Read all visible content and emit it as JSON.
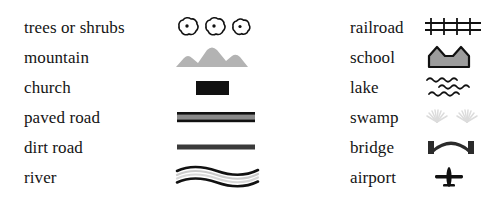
{
  "legend": {
    "columns": [
      {
        "name": "left-column",
        "items": [
          {
            "label": "trees or shrubs",
            "symbol": "trees-symbol"
          },
          {
            "label": "mountain",
            "symbol": "mountain-symbol"
          },
          {
            "label": "church",
            "symbol": "church-symbol"
          },
          {
            "label": "paved road",
            "symbol": "paved-road-symbol"
          },
          {
            "label": "dirt road",
            "symbol": "dirt-road-symbol"
          },
          {
            "label": "river",
            "symbol": "river-symbol"
          }
        ]
      },
      {
        "name": "right-column",
        "items": [
          {
            "label": "railroad",
            "symbol": "railroad-symbol"
          },
          {
            "label": "school",
            "symbol": "school-symbol"
          },
          {
            "label": "lake",
            "symbol": "lake-symbol"
          },
          {
            "label": "swamp",
            "symbol": "swamp-symbol"
          },
          {
            "label": "bridge",
            "symbol": "bridge-symbol"
          },
          {
            "label": "airport",
            "symbol": "airport-symbol"
          }
        ]
      }
    ]
  },
  "colors": {
    "background": "#ffffff",
    "text": "#141414",
    "ink_black": "#111111",
    "mountain_gray": "#b3b3b3",
    "road_gray": "#8a8a8a",
    "river_gray": "#cfcfcf",
    "school_gray": "#9c9c9c",
    "swamp_gray": "#dcdcdc"
  }
}
